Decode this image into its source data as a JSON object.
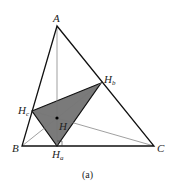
{
  "diagram": {
    "caption": "(a)",
    "colors": {
      "outline": "#111111",
      "thin": "#777777",
      "shade": "#7a7a7a"
    },
    "points": {
      "A": {
        "label": "A",
        "x": 57,
        "y": 26
      },
      "B": {
        "label": "B",
        "x": 22,
        "y": 146
      },
      "C": {
        "label": "C",
        "x": 154,
        "y": 146
      },
      "Ha": {
        "label": "H",
        "sub": "a",
        "x": 57,
        "y": 146
      },
      "Hb": {
        "label": "H",
        "sub": "b",
        "x": 101,
        "y": 83
      },
      "Hc": {
        "label": "H",
        "sub": "c",
        "x": 32,
        "y": 111
      },
      "H": {
        "label": "H",
        "x": 57,
        "y": 118
      }
    }
  }
}
